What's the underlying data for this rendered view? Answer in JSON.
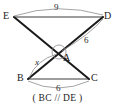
{
  "figure": {
    "caption": "( BC // DE )",
    "vertices": [
      {
        "id": "E",
        "label": "E",
        "x": 14,
        "y": 17,
        "label_x": 3,
        "label_y": 11
      },
      {
        "id": "D",
        "label": "D",
        "x": 103,
        "y": 17,
        "label_x": 104,
        "label_y": 11
      },
      {
        "id": "A",
        "label": "A",
        "x": 59,
        "y": 52,
        "label_x": 63,
        "label_y": 53
      },
      {
        "id": "B",
        "label": "B",
        "x": 28,
        "y": 79,
        "label_x": 17,
        "label_y": 73
      },
      {
        "id": "C",
        "label": "C",
        "x": 89,
        "y": 79,
        "label_x": 91,
        "label_y": 73
      }
    ],
    "segments": [
      {
        "name": "segment-ED",
        "from": "E",
        "to": "D",
        "style": "thin"
      },
      {
        "name": "segment-BC",
        "from": "B",
        "to": "C",
        "style": "thin"
      },
      {
        "name": "segment-EC",
        "from": "E",
        "to": "C",
        "style": "thick"
      },
      {
        "name": "segment-DB",
        "from": "D",
        "to": "B",
        "style": "thick"
      }
    ],
    "measures": [
      {
        "name": "measure-ED",
        "text": "9",
        "label_x": 54,
        "label_y": 3,
        "arc": "M 14 16 Q 58 2 103 15"
      },
      {
        "name": "measure-DA",
        "text": "6",
        "label_x": 84,
        "label_y": 36,
        "arc": "M 103 19 Q 90 34 62 51"
      },
      {
        "name": "measure-BA",
        "text": "x",
        "label_x": 35,
        "label_y": 58,
        "arc": "M 29 78 Q 36 60 57 54"
      },
      {
        "name": "measure-BC",
        "text": "6",
        "label_x": 56,
        "label_y": 84,
        "arc": "M 28 81 Q 58 95 89 81"
      }
    ],
    "angle_marker": {
      "name": "angle-marker-a",
      "cx": 59,
      "cy": 52,
      "r": 7
    },
    "colors": {
      "stroke_thick": "#1a1a1a",
      "stroke_thin": "#3a3a3a",
      "arc": "#8d8d8d",
      "background": "#ffffff",
      "text": "#1a1a1a"
    }
  }
}
